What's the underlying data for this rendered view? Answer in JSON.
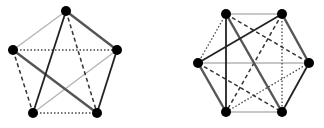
{
  "styles": {
    "light": {
      "stroke": "#b4b4b4",
      "width": 1.4,
      "dash": ""
    },
    "dark": {
      "stroke": "#555555",
      "width": 2.4,
      "dash": ""
    },
    "black": {
      "stroke": "#222222",
      "width": 1.8,
      "dash": ""
    },
    "dashed": {
      "stroke": "#333333",
      "width": 1.5,
      "dash": "4 3"
    },
    "dotted": {
      "stroke": "#444444",
      "width": 1.3,
      "dash": "1.5 2"
    }
  },
  "node_color": "#000000",
  "node_radius": 5,
  "graphs": [
    {
      "name": "pentagon-graph",
      "nodes": [
        {
          "id": "top",
          "x": 66,
          "y": 11
        },
        {
          "id": "left",
          "x": 13,
          "y": 50
        },
        {
          "id": "right",
          "x": 117,
          "y": 50
        },
        {
          "id": "bottom-left",
          "x": 33,
          "y": 113
        },
        {
          "id": "bottom-right",
          "x": 97,
          "y": 113
        }
      ],
      "edges": [
        {
          "from": "top",
          "to": "left",
          "style": "light"
        },
        {
          "from": "right",
          "to": "bottom-left",
          "style": "light"
        },
        {
          "from": "left",
          "to": "right",
          "style": "dotted"
        },
        {
          "from": "bottom-left",
          "to": "bottom-right",
          "style": "dotted"
        },
        {
          "from": "top",
          "to": "bottom-right",
          "style": "dashed"
        },
        {
          "from": "left",
          "to": "bottom-left",
          "style": "dashed"
        },
        {
          "from": "top",
          "to": "right",
          "style": "dark"
        },
        {
          "from": "left",
          "to": "bottom-right",
          "style": "dark"
        },
        {
          "from": "top",
          "to": "bottom-left",
          "style": "black"
        },
        {
          "from": "right",
          "to": "bottom-right",
          "style": "black"
        }
      ]
    },
    {
      "name": "hexagon-graph",
      "nodes": [
        {
          "id": "top-left",
          "x": 226,
          "y": 14
        },
        {
          "id": "top-right",
          "x": 282,
          "y": 14
        },
        {
          "id": "left",
          "x": 198,
          "y": 63
        },
        {
          "id": "right",
          "x": 309,
          "y": 63
        },
        {
          "id": "bottom-left",
          "x": 226,
          "y": 112
        },
        {
          "id": "bottom-right",
          "x": 282,
          "y": 112
        }
      ],
      "edges": [
        {
          "from": "top-left",
          "to": "top-right",
          "style": "light"
        },
        {
          "from": "left",
          "to": "right",
          "style": "light"
        },
        {
          "from": "bottom-left",
          "to": "bottom-right",
          "style": "light"
        },
        {
          "from": "top-left",
          "to": "left",
          "style": "dotted"
        },
        {
          "from": "top-right",
          "to": "bottom-right",
          "style": "dotted"
        },
        {
          "from": "right",
          "to": "bottom-left",
          "style": "dotted"
        },
        {
          "from": "top-left",
          "to": "right",
          "style": "dashed"
        },
        {
          "from": "top-right",
          "to": "bottom-left",
          "style": "dashed"
        },
        {
          "from": "left",
          "to": "bottom-right",
          "style": "dashed"
        },
        {
          "from": "top-left",
          "to": "bottom-right",
          "style": "dark"
        },
        {
          "from": "top-right",
          "to": "right",
          "style": "dark"
        },
        {
          "from": "left",
          "to": "bottom-left",
          "style": "dark"
        },
        {
          "from": "top-left",
          "to": "bottom-left",
          "style": "black"
        },
        {
          "from": "top-right",
          "to": "left",
          "style": "black"
        },
        {
          "from": "right",
          "to": "bottom-right",
          "style": "black"
        }
      ]
    }
  ]
}
